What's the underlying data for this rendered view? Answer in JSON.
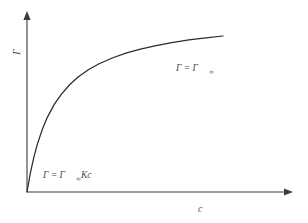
{
  "figure": {
    "title": "",
    "background_color": "#ffffff",
    "axis_color": "#3c3c3c",
    "curve_color": "#2b2b2b",
    "text_color": "#4a4a4a"
  },
  "axes": {
    "y": {
      "label": "Γ",
      "label_name": "surface-excess-concentration",
      "has_arrow": true,
      "ticks": []
    },
    "x": {
      "label": "c",
      "label_name": "bulk-concentration",
      "has_arrow": true,
      "ticks": []
    }
  },
  "annotations": [
    {
      "id": "plateau-label",
      "base": "Γ = Γ",
      "subscript": "∞",
      "full_text": "Γ = Γ∞",
      "meaning": "saturation-plateau"
    },
    {
      "id": "linear-label",
      "base": "Γ = Γ",
      "subscript": "∞",
      "tail": "Kc",
      "full_text": "Γ = Γ∞Kc",
      "meaning": "low-concentration-linear-limit"
    }
  ],
  "chart_data": {
    "type": "line",
    "title": "",
    "xlabel": "c",
    "ylabel": "Γ",
    "grid": false,
    "legend": null,
    "xlim": [
      0,
      1.25
    ],
    "ylim": [
      0,
      1.15
    ],
    "model": "Langmuir adsorption isotherm",
    "equation": "Γ = Γ∞ K c / (1 + K c)",
    "parameters": {
      "Gamma_inf": 1.0,
      "K": 6.0
    },
    "series": [
      {
        "name": "Langmuir isotherm",
        "x": [
          0.0,
          0.02,
          0.04,
          0.06,
          0.09,
          0.12,
          0.16,
          0.2,
          0.25,
          0.3,
          0.36,
          0.42,
          0.5,
          0.58,
          0.66,
          0.75,
          0.85,
          0.95,
          1.05,
          1.15
        ],
        "y": [
          0.0,
          0.107,
          0.194,
          0.265,
          0.351,
          0.419,
          0.49,
          0.545,
          0.6,
          0.643,
          0.684,
          0.716,
          0.75,
          0.777,
          0.798,
          0.818,
          0.836,
          0.851,
          0.863,
          0.873
        ]
      }
    ],
    "asymptote": {
      "label": "Γ∞",
      "value": 1.0
    }
  }
}
